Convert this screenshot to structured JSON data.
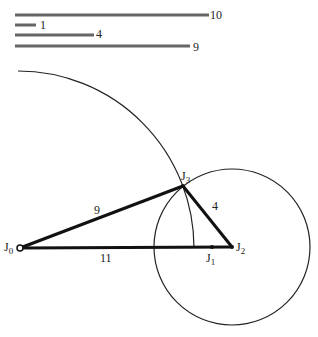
{
  "legend": {
    "bars": [
      {
        "label": "10",
        "length": 10
      },
      {
        "label": "1",
        "length": 1
      },
      {
        "label": "4",
        "length": 4
      },
      {
        "label": "9",
        "length": 9
      }
    ]
  },
  "joints": {
    "j0": {
      "name": "J",
      "sub": "0"
    },
    "j1": {
      "name": "J",
      "sub": "1"
    },
    "j2": {
      "name": "J",
      "sub": "2"
    },
    "j3": {
      "name": "J",
      "sub": "3"
    }
  },
  "links": {
    "j0_j3": "9",
    "j3_j2": "4",
    "j0_j2": "11"
  },
  "colors": {
    "line": "#222222",
    "bar": "#555555"
  }
}
